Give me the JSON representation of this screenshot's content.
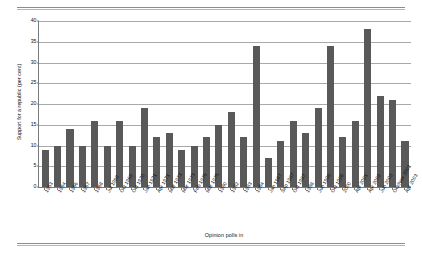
{
  "chart_data": {
    "type": "bar",
    "title": "",
    "xlabel": "Opinion polls in",
    "ylabel": "Support for a republic (per cent)",
    "ylim": [
      0,
      40
    ],
    "ytick_step": 5,
    "yticks": [
      0,
      5,
      10,
      15,
      20,
      25,
      30,
      35,
      40
    ],
    "grid": true,
    "legend": false,
    "bar_color": "#595959",
    "categories": [
      "1953",
      "1964",
      "1966",
      "1967",
      "1968",
      "Jul 1969",
      "Oct 1969",
      "Oct 1970",
      "Jan 1971",
      "Apr 1971",
      "Mar 1973",
      "Mar 1973",
      "Feb 1975",
      "Mar 1975",
      "1980",
      "1982",
      "1983",
      "1984",
      "Jan 1987",
      "Sep 1987",
      "Oct 1987",
      "1988",
      "Jun 1996",
      "Oct 1996",
      "2000",
      "Apr 2001",
      "Apr 2002",
      "Jun 2002",
      "Oct/Nov 2002",
      "Apr 2003"
    ],
    "values": [
      9,
      10,
      14,
      10,
      16,
      10,
      16,
      10,
      19,
      12,
      13,
      9,
      10,
      12,
      15,
      18,
      12,
      34,
      7,
      11,
      16,
      13,
      19,
      34,
      12,
      16,
      38,
      22,
      21,
      11
    ],
    "values_display": [
      "9",
      "10",
      "14",
      "10",
      "16",
      "10",
      "16",
      "10",
      "19",
      "12",
      "13",
      "9",
      "10",
      "12",
      "15",
      "18",
      "12",
      "34",
      "7",
      "11",
      "16",
      "13",
      "19",
      "34",
      "12",
      "16",
      "38",
      "22",
      "21",
      "11"
    ]
  },
  "axis": {
    "y_title": "Support for a republic (per cent)",
    "x_title": "Opinion polls in"
  }
}
